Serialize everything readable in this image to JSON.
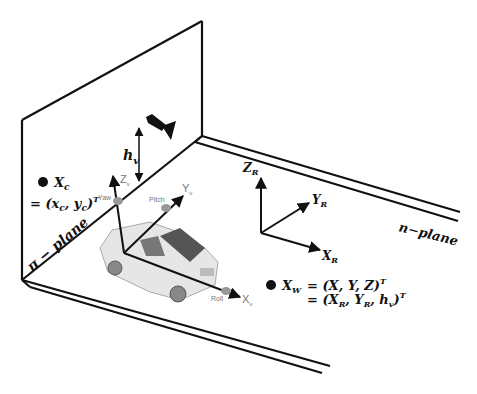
{
  "diagram": {
    "planes": {
      "pi_plane_label": "π − plane",
      "n_plane_label": "n−plane"
    },
    "camera": {
      "height_label": "h",
      "height_sub": "v"
    },
    "vehicle_axes": {
      "z_label": "Z",
      "z_sub": "v",
      "y_label": "Y",
      "y_sub": "v",
      "x_label": "X",
      "x_sub": "v",
      "yaw_label": "Yaw",
      "pitch_label": "Pitch",
      "roll_label": "Roll"
    },
    "road_axes": {
      "z_label": "Z",
      "y_label": "Y",
      "x_label": "X",
      "sub": "R"
    },
    "camera_point": {
      "name": "X",
      "name_sub": "c",
      "eq_line": "= (x",
      "eq_c1": "c",
      "eq_mid": ", y",
      "eq_c2": "c",
      "eq_end": ")",
      "eq_sup": "T"
    },
    "world_point": {
      "name": "X",
      "name_sub": "W",
      "line1": "= (X, Y, Z)",
      "line1_sup": "T",
      "line2_a": "= (X",
      "line2_sub1": "R",
      "line2_b": ", Y",
      "line2_sub2": "R",
      "line2_c": ", h",
      "line2_sub3": "v",
      "line2_d": ")",
      "line2_sup": "T"
    }
  }
}
